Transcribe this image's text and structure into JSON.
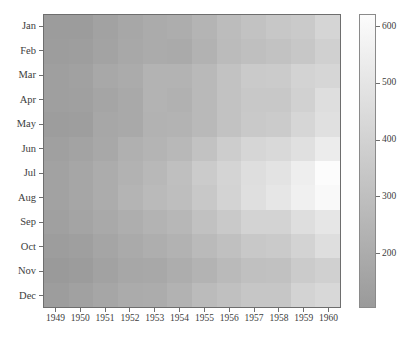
{
  "figure": {
    "background_color": "#ffffff",
    "ghost_text_top": "",
    "ghost_text_bottom": ""
  },
  "colorbar": {
    "tick_labels": [
      "600",
      "500",
      "400",
      "300",
      "200"
    ],
    "tick_values": [
      600,
      500,
      400,
      300,
      200
    ],
    "vmin": 104,
    "vmax": 622,
    "low_color": "#9a9a9a",
    "high_color": "#fcfcfc",
    "orientation": "vertical",
    "position": "right"
  },
  "chart_data": {
    "type": "heatmap",
    "title": "",
    "xlabel": "",
    "ylabel": "",
    "legend": "",
    "grid": false,
    "colormap": "grayscale",
    "x": [
      "1949",
      "1950",
      "1951",
      "1952",
      "1953",
      "1954",
      "1955",
      "1956",
      "1957",
      "1958",
      "1959",
      "1960"
    ],
    "y": [
      "Jan",
      "Feb",
      "Mar",
      "Apr",
      "May",
      "Jun",
      "Jul",
      "Aug",
      "Sep",
      "Oct",
      "Nov",
      "Dec"
    ],
    "xlabel_ticks": [
      "1949",
      "1950",
      "1951",
      "1952",
      "1953",
      "1954",
      "1955",
      "1956",
      "1957",
      "1958",
      "1959",
      "1960"
    ],
    "ylabel_ticks": [
      "Jan",
      "Feb",
      "Mar",
      "Apr",
      "May",
      "Jun",
      "Jul",
      "Aug",
      "Sep",
      "Oct",
      "Nov",
      "Dec"
    ],
    "zmin": 104,
    "zmax": 622,
    "values": [
      [
        112,
        115,
        145,
        171,
        196,
        204,
        242,
        284,
        315,
        340,
        360,
        417
      ],
      [
        118,
        126,
        150,
        180,
        196,
        188,
        233,
        277,
        301,
        318,
        342,
        391
      ],
      [
        132,
        141,
        178,
        193,
        236,
        235,
        267,
        317,
        356,
        362,
        406,
        419
      ],
      [
        129,
        135,
        163,
        181,
        235,
        227,
        269,
        313,
        348,
        348,
        396,
        461
      ],
      [
        121,
        125,
        172,
        183,
        229,
        234,
        270,
        318,
        355,
        363,
        420,
        472
      ],
      [
        135,
        149,
        178,
        218,
        243,
        264,
        315,
        374,
        422,
        435,
        472,
        535
      ],
      [
        148,
        170,
        199,
        230,
        264,
        302,
        364,
        413,
        465,
        491,
        548,
        622
      ],
      [
        148,
        170,
        199,
        242,
        272,
        293,
        347,
        405,
        467,
        505,
        559,
        606
      ],
      [
        136,
        158,
        184,
        209,
        237,
        259,
        312,
        355,
        404,
        404,
        463,
        508
      ],
      [
        119,
        133,
        162,
        191,
        211,
        229,
        274,
        306,
        347,
        359,
        407,
        461
      ],
      [
        104,
        114,
        146,
        172,
        180,
        203,
        237,
        271,
        305,
        310,
        362,
        390
      ],
      [
        118,
        140,
        166,
        194,
        201,
        229,
        278,
        306,
        336,
        337,
        405,
        432
      ]
    ]
  }
}
